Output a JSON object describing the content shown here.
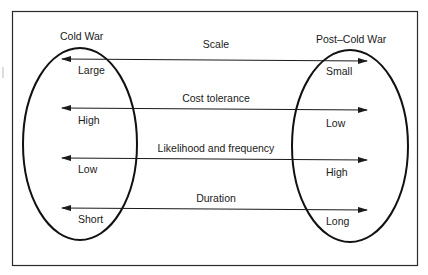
{
  "diagram": {
    "left_group": {
      "title": "Cold War"
    },
    "right_group": {
      "title": "Post–Cold War"
    },
    "dimensions": [
      {
        "name": "Scale",
        "left": "Large",
        "right": "Small"
      },
      {
        "name": "Cost tolerance",
        "left": "High",
        "right": "Low"
      },
      {
        "name": "Likelihood and frequency",
        "left": "Low",
        "right": "High"
      },
      {
        "name": "Duration",
        "left": "Short",
        "right": "Long"
      }
    ],
    "colors": {
      "stroke": "#1a1a1a",
      "background": "#ffffff"
    }
  }
}
